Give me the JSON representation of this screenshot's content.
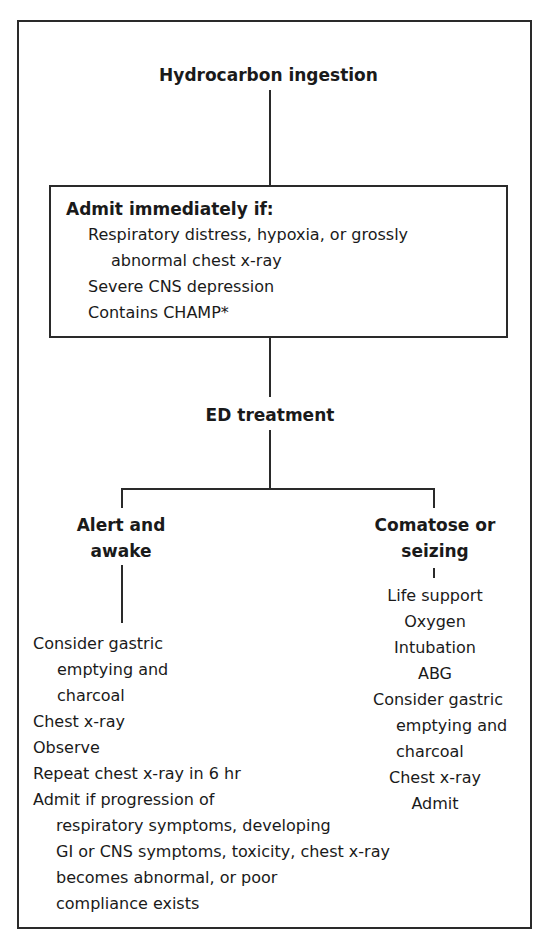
{
  "diagram": {
    "root": {
      "label": "Hydrocarbon ingestion"
    },
    "admit_box": {
      "heading": "Admit immediately if:",
      "items": [
        {
          "line1": "Respiratory distress, hypoxia, or grossly",
          "line2": "abnormal chest x-ray"
        },
        {
          "line1": "Severe CNS depression"
        },
        {
          "line1": "Contains CHAMP*"
        }
      ]
    },
    "ed_treatment": {
      "label": "ED treatment"
    },
    "branches": {
      "left": {
        "heading_line1": "Alert and",
        "heading_line2": "awake",
        "steps": [
          {
            "line1": "Consider gastric",
            "line2": "emptying and",
            "line3": "charcoal"
          },
          {
            "line1": "Chest x-ray"
          },
          {
            "line1": "Observe"
          },
          {
            "line1": "Repeat chest x-ray in 6 hr"
          },
          {
            "line1": "Admit if progression of",
            "line2": "respiratory symptoms, developing",
            "line3": "GI or CNS symptoms, toxicity, chest x-ray",
            "line4": "becomes abnormal, or poor",
            "line5": "compliance exists"
          }
        ]
      },
      "right": {
        "heading_line1": "Comatose or",
        "heading_line2": "seizing",
        "steps": [
          {
            "line1": "Life support"
          },
          {
            "line1": "Oxygen"
          },
          {
            "line1": "Intubation"
          },
          {
            "line1": "ABG"
          },
          {
            "line1": "Consider gastric",
            "line2": "emptying and",
            "line3": "charcoal"
          },
          {
            "line1": "Chest x-ray"
          },
          {
            "line1": "Admit"
          }
        ]
      }
    }
  }
}
